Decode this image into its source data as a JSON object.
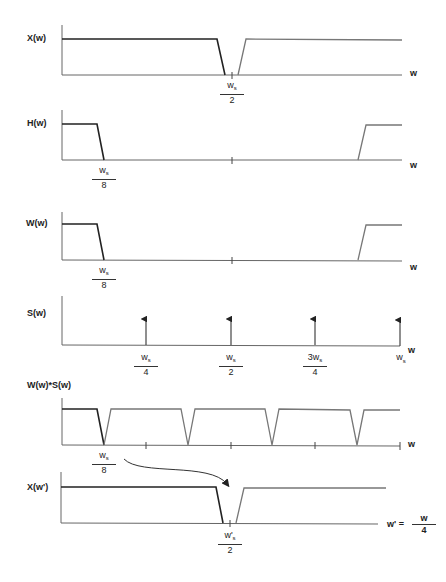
{
  "figure": {
    "colors": {
      "axis": "#555555",
      "dark_segment": "#222222",
      "light_segment": "#777777"
    }
  },
  "panels": [
    {
      "id": "x",
      "ylabel": "X(w)",
      "xlabel": "w",
      "ticks": [
        {
          "num": "w",
          "sub": "s",
          "den": "2"
        }
      ]
    },
    {
      "id": "h",
      "ylabel": "H(w)",
      "xlabel": "w",
      "ticks": [
        {
          "num": "w",
          "sub": "s",
          "den": "8"
        }
      ]
    },
    {
      "id": "w",
      "ylabel": "W(w)",
      "xlabel": "w",
      "ticks": [
        {
          "num": "w",
          "sub": "s",
          "den": "8"
        }
      ]
    },
    {
      "id": "s",
      "ylabel": "S(w)",
      "xlabel": "w",
      "ticks": [
        {
          "num": "w",
          "sub": "s",
          "den": "4"
        },
        {
          "num": "w",
          "sub": "s",
          "den": "2"
        },
        {
          "num": "3w",
          "sub": "s",
          "den": "4"
        },
        {
          "num": "w",
          "sub": "s",
          "den": ""
        }
      ]
    },
    {
      "id": "ws",
      "ylabel": "W(w)*S(w)",
      "xlabel": "w",
      "ticks": [
        {
          "num": "w",
          "sub": "s",
          "den": "8"
        }
      ]
    },
    {
      "id": "xp",
      "ylabel": "X(w')",
      "xlabel": "w' =",
      "xlabel_frac": {
        "num": "w",
        "den": "4"
      },
      "ticks": [
        {
          "num": "w'",
          "sub": "s",
          "den": "2"
        }
      ]
    }
  ]
}
